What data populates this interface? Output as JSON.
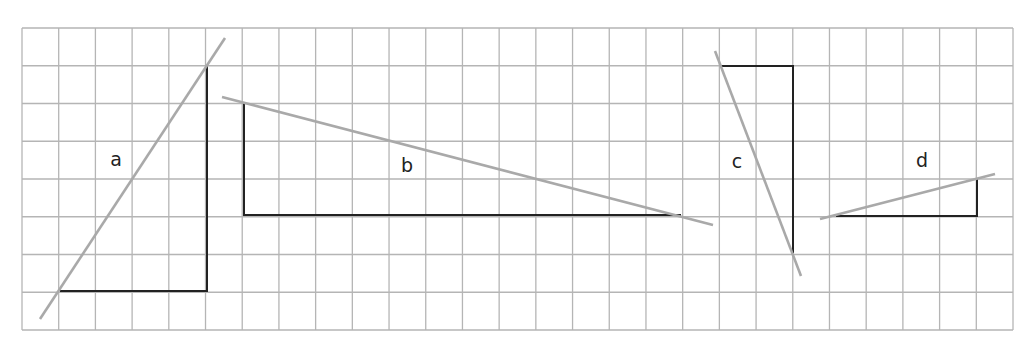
{
  "grid": {
    "x0": 22,
    "y0": 28,
    "x1": 1013,
    "y1": 330,
    "cols": 27,
    "rows": 8,
    "line_color": "#b5b5b5"
  },
  "colors": {
    "triangle": "#222222",
    "line": "#a9a9a9"
  },
  "figures": [
    {
      "label": "a",
      "label_pos": [
        116,
        166
      ],
      "leg": [
        [
          60,
          291
        ],
        [
          207,
          291
        ],
        [
          207,
          66
        ]
      ],
      "line": [
        [
          40,
          319
        ],
        [
          225,
          38
        ]
      ]
    },
    {
      "label": "b",
      "label_pos": [
        407,
        172
      ],
      "leg": [
        [
          244,
          103
        ],
        [
          244,
          215
        ],
        [
          681,
          215
        ]
      ],
      "line": [
        [
          222,
          97
        ],
        [
          713,
          225
        ]
      ]
    },
    {
      "label": "c",
      "label_pos": [
        737,
        168
      ],
      "leg": [
        [
          721,
          66
        ],
        [
          793,
          66
        ],
        [
          793,
          253
        ]
      ],
      "line": [
        [
          715,
          51
        ],
        [
          801,
          276
        ]
      ]
    },
    {
      "label": "d",
      "label_pos": [
        922,
        167
      ],
      "leg": [
        [
          836,
          216
        ],
        [
          977,
          216
        ],
        [
          977,
          179
        ]
      ],
      "line": [
        [
          820,
          219
        ],
        [
          995,
          174
        ]
      ]
    }
  ]
}
